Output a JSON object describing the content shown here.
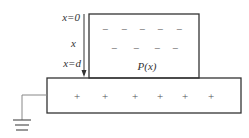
{
  "diagram": {
    "axis_labels": {
      "top": "x=0",
      "middle": "x",
      "bottom": "x=d"
    },
    "dielectric_label": "P(x)",
    "negative_charge_symbol": "−",
    "positive_charge_symbol": "+",
    "negative_rows": [
      {
        "y": 29,
        "xs": [
          105,
          124,
          142,
          160,
          179
        ]
      },
      {
        "y": 48,
        "xs": [
          114,
          136,
          157,
          175
        ]
      }
    ],
    "positive_row": {
      "y": 96,
      "xs": [
        77,
        105,
        135,
        160,
        185,
        211
      ]
    },
    "colors": {
      "stroke": "#333333",
      "ground_wire": "#888888",
      "text": "#333333"
    }
  }
}
